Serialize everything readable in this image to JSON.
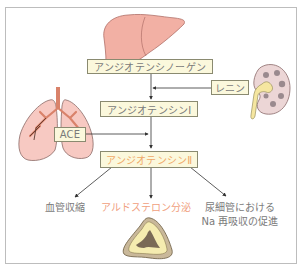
{
  "diagram": {
    "nodes": {
      "angiotensinogen": "アンジオテンシノーゲン",
      "renin": "レニン",
      "angiotensin1": "アンジオテンシンⅠ",
      "ace": "ACE",
      "angiotensin2": "アンジオテンシンⅡ"
    },
    "effects": {
      "vasoconstriction": "血管収縮",
      "aldosterone": "アルドステロン分泌",
      "na_line1": "尿細管における",
      "na_line2": "Na 再吸収の促進"
    },
    "organs": [
      "liver",
      "kidney",
      "lungs",
      "adrenal-gland"
    ],
    "colors": {
      "box_fill": "#fbf8dc",
      "highlight_text": "#f0a868",
      "organ_pink": "#f2b0a4",
      "airway": "#d9826a"
    }
  }
}
